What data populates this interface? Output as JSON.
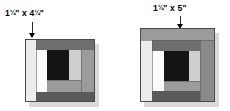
{
  "figure": {
    "type": "quilt-block-diagram",
    "background": "#ffffff"
  },
  "palette": {
    "light": "#ececec",
    "white": "#fbfbfb",
    "medium_light": "#cfcfcf",
    "medium": "#9b9b9b",
    "medium_dark": "#8a8a8a",
    "dark": "#6e6e6e",
    "very_dark": "#5a5a5a",
    "black": "#141414",
    "shadow": "#d9d9d9",
    "outline": "#4a4a4a",
    "text": "#000000"
  },
  "callouts": [
    {
      "id": "left-callout",
      "width_text": "1",
      "width_frac": "1/4",
      "separator": "\" x 4",
      "height_frac": "1/4",
      "tail": "\"",
      "full_text": "1 1/4\" x 4 1/4\"",
      "points_to": "left-block-left-strip"
    },
    {
      "id": "right-callout",
      "width_text": "1",
      "width_frac": "1/4",
      "separator": "\" x 5\"",
      "height_frac": "",
      "tail": "",
      "full_text": "1 1/4\" x 5\"",
      "points_to": "right-block-top-strip"
    }
  ],
  "blocks": [
    {
      "id": "left-block",
      "name": "log-cabin-block-left",
      "strips": [
        {
          "name": "left-strip",
          "tone": "light"
        },
        {
          "name": "top-strip",
          "tone": "dark"
        },
        {
          "name": "right-strip",
          "tone": "medium"
        },
        {
          "name": "bottom-strip",
          "tone": "very_dark"
        },
        {
          "name": "inner-left-strip",
          "tone": "white"
        },
        {
          "name": "inner-right-strip",
          "tone": "medium_light"
        },
        {
          "name": "inner-bottom-strip",
          "tone": "medium"
        },
        {
          "name": "center-square",
          "tone": "black"
        }
      ]
    },
    {
      "id": "right-block",
      "name": "log-cabin-block-right",
      "strips": [
        {
          "name": "top-strip",
          "tone": "medium"
        },
        {
          "name": "left-strip",
          "tone": "light"
        },
        {
          "name": "right-strip",
          "tone": "medium_dark"
        },
        {
          "name": "bottom-strip",
          "tone": "very_dark"
        },
        {
          "name": "inner-top-strip",
          "tone": "dark"
        },
        {
          "name": "inner-left-strip",
          "tone": "white"
        },
        {
          "name": "inner-right-strip",
          "tone": "medium_light"
        },
        {
          "name": "inner-bottom-strip",
          "tone": "medium"
        },
        {
          "name": "center-square",
          "tone": "black"
        }
      ]
    }
  ]
}
